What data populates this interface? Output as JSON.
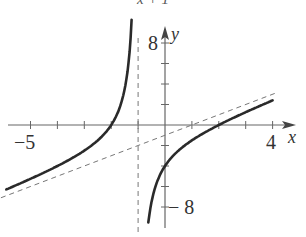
{
  "caption_fragment": "x + 1",
  "chart_data": {
    "type": "line",
    "title": "",
    "function": "y = (x^2 - 4)/(x + 1)",
    "xlabel": "x",
    "ylabel": "y",
    "xlim": [
      -6,
      4.4
    ],
    "ylim": [
      -9,
      8.5
    ],
    "x_ticks": [
      -5,
      -4,
      -3,
      -2,
      -1,
      1,
      2,
      3,
      4
    ],
    "y_ticks": [
      -8,
      -6,
      -4,
      -2,
      2,
      4,
      6,
      8
    ],
    "tick_labels": {
      "x": [
        "-5",
        "4"
      ],
      "y": [
        "8",
        "-8"
      ]
    },
    "grid": false,
    "asymptotes": [
      {
        "type": "vertical",
        "x": -1,
        "style": "dashed"
      },
      {
        "type": "oblique",
        "equation": "y = x - 1",
        "style": "dashed"
      }
    ],
    "series": [
      {
        "name": "left-branch",
        "x": [
          -5.9,
          -5,
          -4,
          -3,
          -2.5,
          -2,
          -1.6,
          -1.4,
          -1.25
        ],
        "y": [
          -6.3,
          -5.25,
          -4.0,
          -2.5,
          -1.5,
          0.0,
          2.3,
          5.1,
          9.75
        ]
      },
      {
        "name": "right-branch",
        "x": [
          -0.6,
          -0.4,
          0,
          0.5,
          1,
          2,
          3,
          4
        ],
        "y": [
          -9.1,
          -6.4,
          -4.0,
          -2.5,
          -1.5,
          0.0,
          1.25,
          2.4
        ]
      }
    ],
    "legend": null
  },
  "axes": {
    "x_label": "x",
    "y_label": "y",
    "x_min_label": "−5",
    "x_max_label": "4",
    "y_max_label": "8",
    "y_min_label": "− 8"
  }
}
